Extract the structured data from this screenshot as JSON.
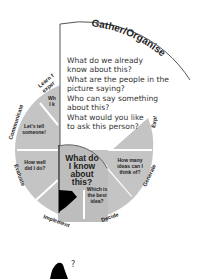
{
  "diagram": {
    "highlighted_stage": {
      "title": "Gather/Organise",
      "questions": [
        "What do we already know about this?",
        "What are the people in the picture saying?",
        "Who can say something about this?",
        "What would you like to ask this person?"
      ],
      "questions_lines": [
        [
          "What do we already",
          "know about this?"
        ],
        [
          "What are the people in the",
          "picture saying?"
        ],
        [
          "Who can say something",
          "about this?"
        ],
        [
          "What would you like",
          "to ask this person?"
        ]
      ]
    },
    "center": {
      "lines": [
        "What do",
        "I know",
        "about",
        "this?"
      ]
    },
    "stages": [
      {
        "label": "Learn from experience",
        "visible_label": "Learn f... exper...",
        "inner_text": [
          "Wh...",
          "I k..."
        ]
      },
      {
        "label": "Communicate",
        "inner_text": [
          "Let's tell",
          "someone!"
        ]
      },
      {
        "label": "Evaluate",
        "inner_text": [
          "How well",
          "did I do?"
        ]
      },
      {
        "label": "Implement",
        "inner_text": []
      },
      {
        "label": "Decide",
        "inner_text": [
          "Which is",
          "the best",
          "idea?"
        ]
      },
      {
        "label": "Generate",
        "inner_text": [
          "How many",
          "ideas can I",
          "think of?"
        ]
      },
      {
        "label": "Explore",
        "visible_label": "Expl...",
        "inner_text": []
      }
    ],
    "colors": {
      "segment_fill": "#c4c4c4",
      "segment_divider": "#ffffff",
      "outline": "#555555",
      "flag": "#000000"
    },
    "figure": {
      "symbol": "?"
    }
  }
}
